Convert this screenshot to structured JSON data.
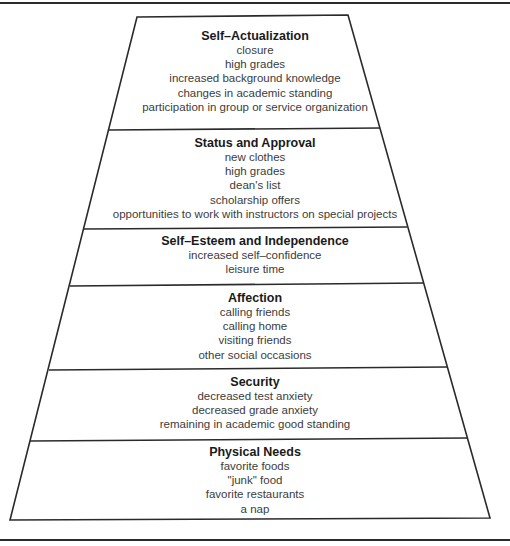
{
  "diagram": {
    "type": "pyramid",
    "colors": {
      "line": "#2a2a2a",
      "title_text": "#1a1a1a",
      "item_text": "#3c3c3c",
      "background": "#ffffff"
    },
    "layers": [
      {
        "title": "Self–Actualization",
        "items": [
          "closure",
          "high grades",
          "increased background knowledge",
          "changes in academic standing",
          "participation in group or service organization"
        ]
      },
      {
        "title": "Status and Approval",
        "items": [
          "new clothes",
          "high grades",
          "dean's list",
          "scholarship offers",
          "opportunities to work with instructors on special projects"
        ]
      },
      {
        "title": "Self–Esteem and Independence",
        "items": [
          "increased self–confidence",
          "leisure time"
        ]
      },
      {
        "title": "Affection",
        "items": [
          "calling friends",
          "calling home",
          "visiting friends",
          "other social occasions"
        ]
      },
      {
        "title": "Security",
        "items": [
          "decreased test anxiety",
          "decreased grade anxiety",
          "remaining in academic good standing"
        ]
      },
      {
        "title": "Physical Needs",
        "items": [
          "favorite foods",
          "\"junk\" food",
          "favorite restaurants",
          "a nap"
        ]
      }
    ]
  }
}
